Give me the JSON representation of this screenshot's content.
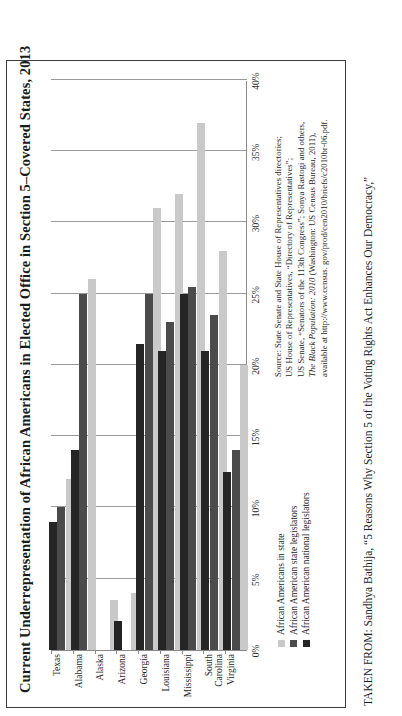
{
  "figure": {
    "title": "Current Underrepresentation of African Americans in Elected Office in Section 5–Covered States, 2013",
    "caption": "TAKEN FROM: Sandhya Bathija, “5 Reasons Why Section 5 of the Voting Rights Act Enhances Our Democracy,”"
  },
  "legend": {
    "items": [
      {
        "label": "African Americans in state",
        "color": "#c9c9c9"
      },
      {
        "label": "African American state legislators",
        "color": "#4b4b4b"
      },
      {
        "label": "African American national legislators",
        "color": "#252525"
      }
    ]
  },
  "source": {
    "line1": "Source: State Senate and State House of Representatives directories;",
    "line2": "US House of Representatives, “Directory of Representatives”;",
    "line3": "US Senate, “Senators of the 113th Congress”; Sonya Rastogi and others,",
    "line4_italic": "The Black Population: 2010",
    "line4_rest": " (Washington: US Census Bureau, 2011),",
    "line5": "available at http://www.census. gov/prod/cen2010/briefs/c2010br-06.pdf."
  },
  "chart_data": {
    "type": "bar",
    "orientation": "vertical",
    "title": "Current Underrepresentation of African Americans in Elected Office in Section 5–Covered States, 2013",
    "xlabel": "",
    "ylabel": "",
    "ylim": [
      0,
      40
    ],
    "ytick_labels": [
      "0%",
      "5%",
      "10%",
      "15%",
      "20%",
      "25%",
      "30%",
      "35%",
      "40%"
    ],
    "ytick_values": [
      0,
      5,
      10,
      15,
      20,
      25,
      30,
      35,
      40
    ],
    "grid": true,
    "legend_position": "below-left",
    "categories": [
      "Texas",
      "Alabama",
      "Alaska",
      "Arizona",
      "Georgia",
      "Louisiana",
      "Mississippi",
      "South Carolina",
      "Virginia"
    ],
    "series": [
      {
        "name": "African Americans in state",
        "color": "#c9c9c9",
        "values": [
          12.0,
          26.0,
          3.5,
          4.0,
          31.0,
          32.0,
          37.0,
          28.0,
          20.0
        ]
      },
      {
        "name": "African American state legislators",
        "color": "#4b4b4b",
        "values": [
          10.0,
          25.0,
          0.0,
          0.0,
          25.0,
          23.0,
          25.5,
          23.5,
          14.0
        ]
      },
      {
        "name": "African American national legislators",
        "color": "#252525",
        "values": [
          9.0,
          14.0,
          0.0,
          2.0,
          21.5,
          21.0,
          25.0,
          21.0,
          12.5
        ]
      }
    ]
  }
}
